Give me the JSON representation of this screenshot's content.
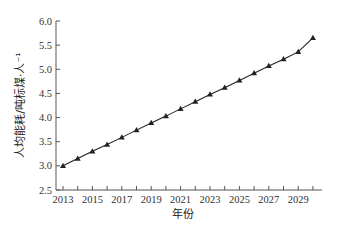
{
  "chart_data": {
    "type": "line",
    "title": "",
    "xlabel": "年份",
    "ylabel": "人均能耗/吨标煤·人⁻¹",
    "x": [
      2013,
      2014,
      2015,
      2016,
      2017,
      2018,
      2019,
      2020,
      2021,
      2022,
      2023,
      2024,
      2025,
      2026,
      2027,
      2028,
      2029,
      2030
    ],
    "series": [
      {
        "name": "人均能耗",
        "marker": "triangle",
        "color": "#222222",
        "values": [
          3.0,
          3.15,
          3.3,
          3.44,
          3.59,
          3.74,
          3.89,
          4.03,
          4.18,
          4.33,
          4.48,
          4.62,
          4.77,
          4.92,
          5.07,
          5.21,
          5.36,
          5.65
        ]
      }
    ],
    "x_tick_labels": [
      "2013",
      "2015",
      "2017",
      "2019",
      "2021",
      "2023",
      "2025",
      "2027",
      "2029"
    ],
    "y_tick_labels": [
      "2.5",
      "3.0",
      "3.5",
      "4.0",
      "4.5",
      "5.0",
      "5.5",
      "6.0"
    ],
    "xlim": [
      2013,
      2030.6
    ],
    "ylim": [
      2.5,
      6.0
    ],
    "grid": false,
    "legend": "none"
  },
  "axis": {
    "xlabel": "年份",
    "ylabel": "人均能耗/吨标煤·人⁻¹"
  }
}
